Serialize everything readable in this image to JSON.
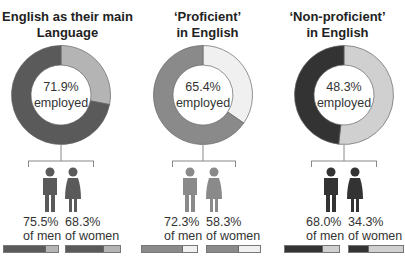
{
  "chart_data": [
    {
      "type": "pie",
      "title": "English as their main Language",
      "center_label": "71.9%",
      "center_sub": "employed",
      "employed_pct": 71.9,
      "slices": [
        {
          "label": "employed",
          "value": 71.9,
          "color": "#5a5a5a"
        },
        {
          "label": "not employed",
          "value": 28.1,
          "color": "#b4b4b4"
        }
      ],
      "gender": [
        {
          "label": "of men",
          "pct_text": "75.5%",
          "value": 75.5,
          "fill": "#5a5a5a",
          "rest": "#b4b4b4"
        },
        {
          "label": "of women",
          "pct_text": "68.3%",
          "value": 68.3,
          "fill": "#5a5a5a",
          "rest": "#b4b4b4"
        }
      ]
    },
    {
      "type": "pie",
      "title": "‘Proficient’ in English",
      "center_label": "65.4%",
      "center_sub": "employed",
      "employed_pct": 65.4,
      "slices": [
        {
          "label": "employed",
          "value": 65.4,
          "color": "#8a8a8a"
        },
        {
          "label": "not employed",
          "value": 34.6,
          "color": "#f0f0f0"
        }
      ],
      "gender": [
        {
          "label": "of men",
          "pct_text": "72.3%",
          "value": 72.3,
          "fill": "#8a8a8a",
          "rest": "#f0f0f0"
        },
        {
          "label": "of women",
          "pct_text": "58.3%",
          "value": 58.3,
          "fill": "#8a8a8a",
          "rest": "#f0f0f0"
        }
      ]
    },
    {
      "type": "pie",
      "title": "‘Non-proficient’ in English",
      "center_label": "48.3%",
      "center_sub": "employed",
      "employed_pct": 48.3,
      "slices": [
        {
          "label": "employed",
          "value": 48.3,
          "color": "#333333"
        },
        {
          "label": "not employed",
          "value": 51.7,
          "color": "#d0d0d0"
        }
      ],
      "gender": [
        {
          "label": "of men",
          "pct_text": "68.0%",
          "value": 68.0,
          "fill": "#333333",
          "rest": "#d0d0d0"
        },
        {
          "label": "of women",
          "pct_text": "34.3%",
          "value": 34.3,
          "fill": "#333333",
          "rest": "#d0d0d0"
        }
      ]
    }
  ],
  "panels": [
    {
      "title_line1": "English as their main",
      "title_line2": "Language",
      "center_pct": "71.9%",
      "center_sub": "employed",
      "men_pct": "75.5%",
      "men_label": "of men",
      "women_pct": "68.3%",
      "women_label": "of women"
    },
    {
      "title_line1": "‘Proficient’",
      "title_line2": "in English",
      "center_pct": "65.4%",
      "center_sub": "employed",
      "men_pct": "72.3%",
      "men_label": "of men",
      "women_pct": "58.3%",
      "women_label": "of women"
    },
    {
      "title_line1": "‘Non-proficient’",
      "title_line2": "in English",
      "center_pct": "48.3%",
      "center_sub": "employed",
      "men_pct": "68.0%",
      "men_label": "of men",
      "women_pct": "34.3%",
      "women_label": "of women"
    }
  ]
}
